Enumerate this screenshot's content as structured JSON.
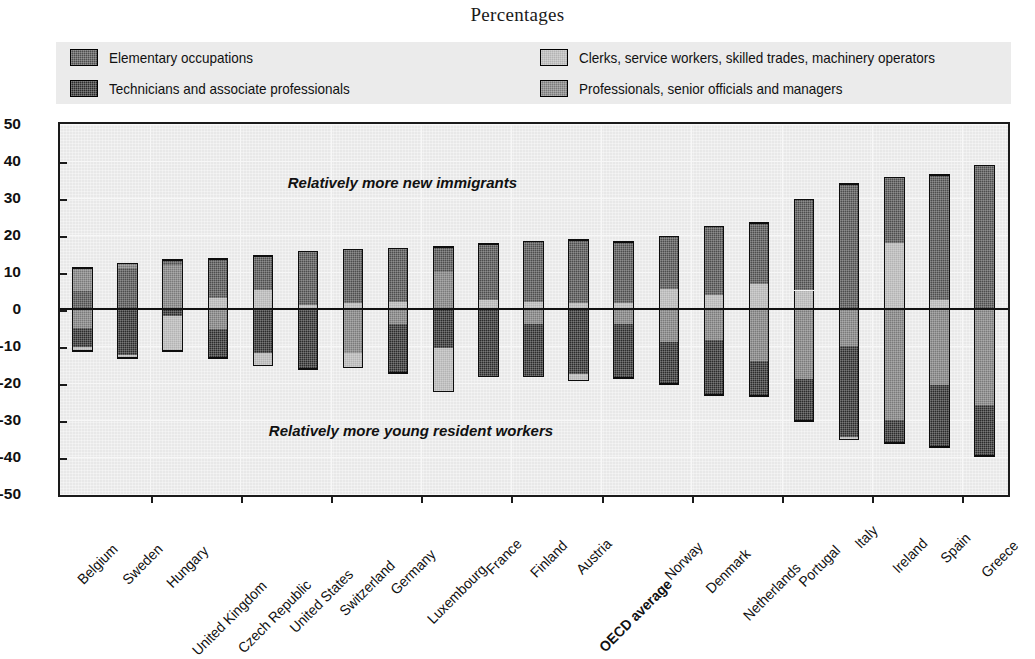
{
  "title": "Percentages",
  "legend": {
    "position": "top",
    "items": [
      {
        "label": "Elementary occupations",
        "color": "#4d4d4d",
        "key": "elementary"
      },
      {
        "label": "Clerks, service workers, skilled trades, machinery operators",
        "color": "#b3b3b3",
        "key": "clerks"
      },
      {
        "label": "Technicians and associate professionals",
        "color": "#2b2b2b",
        "key": "technicians"
      },
      {
        "label": "Professionals, senior officials and managers",
        "color": "#7a7a7a",
        "key": "professionals"
      }
    ]
  },
  "annotations": [
    {
      "text": "Relatively more new immigrants",
      "x_pct": 24,
      "y_value": 34
    },
    {
      "text": "Relatively more young resident workers",
      "x_pct": 22,
      "y_value": -33
    }
  ],
  "chart_data": {
    "type": "bar",
    "subtype": "diverging-stacked",
    "title": "Percentages",
    "xlabel": "",
    "ylabel": "",
    "ylim": [
      -50,
      50
    ],
    "yticks": [
      50,
      40,
      30,
      20,
      10,
      0,
      -10,
      -20,
      -30,
      -40,
      -50
    ],
    "ytick_labels": [
      "50",
      "40",
      "30",
      "20",
      "10",
      "0",
      "-10",
      "-20",
      "-30",
      "-40",
      "-50"
    ],
    "grid": true,
    "zero_line": 0,
    "categories": [
      "Belgium",
      "Sweden",
      "Hungary",
      "United Kingdom",
      "Czech Republic",
      "United States",
      "Switzerland",
      "Germany",
      "Luxembourg",
      "France",
      "Finland",
      "Austria",
      "OECD average",
      "Norway",
      "Denmark",
      "Netherlands",
      "Portugal",
      "Italy",
      "Ireland",
      "Spain",
      "Greece"
    ],
    "highlight_category": "OECD average",
    "series": [
      {
        "name": "Elementary occupations",
        "key": "elementary",
        "color": "#4d4d4d",
        "values": [
          11.3,
          12.5,
          1.0,
          10.6,
          9.2,
          14.5,
          14.5,
          14.7,
          7.0,
          15.5,
          16.2,
          17.0,
          16.8,
          14.5,
          18.8,
          16.8,
          24.6,
          34.0,
          17.8,
          34.0,
          39.0
        ]
      },
      {
        "name": "Clerks, service workers, skilled trades, machinery operators",
        "key": "clerks",
        "color": "#b3b3b3",
        "values": [
          -3.5,
          -1.0,
          -10.5,
          -8.0,
          -16.5,
          -16.5,
          -15.5,
          -2.0,
          -13.0,
          -1.0,
          -2.0,
          -1.5,
          -2.0,
          -9.5,
          -8.5,
          -14.5,
          -19.0,
          -35.5,
          17.8,
          2.5,
          -1.0
        ]
      },
      {
        "name": "Technicians and associate professionals",
        "key": "technicians",
        "color": "#2b2b2b",
        "values": [
          -7.5,
          -13.0,
          -2.5,
          -3.0,
          -3.0,
          -1.0,
          -2.5,
          -15.5,
          -10.0,
          -17.5,
          -16.5,
          -17.5,
          -17.0,
          -11.0,
          -15.0,
          -9.0,
          -11.5,
          -1.5,
          -30.5,
          -17.0,
          -14.0
        ]
      },
      {
        "name": "Professionals, senior officials and managers",
        "key": "professionals",
        "color": "#7a7a7a",
        "values": [
          6.5,
          1.5,
          12.5,
          3.5,
          5.5,
          1.5,
          -2.0,
          2.0,
          17.0,
          2.5,
          2.0,
          1.5,
          1.5,
          5.5,
          4.0,
          7.0,
          5.5,
          -10.0,
          -6.0,
          -20.5,
          -26.0
        ]
      }
    ],
    "stacks": [
      {
        "category": "Belgium",
        "pos": [
          {
            "key": "elementary",
            "from": 0,
            "to": 4.8
          },
          {
            "key": "professionals",
            "from": 4.8,
            "to": 11.3
          }
        ],
        "neg": [
          {
            "key": "professionals",
            "from": 0,
            "to": -5.0
          },
          {
            "key": "technicians",
            "from": -5.0,
            "to": -10.4
          },
          {
            "key": "clerks",
            "from": -10.4,
            "to": -11.6
          }
        ]
      },
      {
        "category": "Sweden",
        "pos": [
          {
            "key": "elementary",
            "from": 0,
            "to": 11.0
          },
          {
            "key": "professionals",
            "from": 11.0,
            "to": 12.5
          }
        ],
        "neg": [
          {
            "key": "technicians",
            "from": 0,
            "to": -12.5
          },
          {
            "key": "clerks",
            "from": -12.5,
            "to": -13.5
          }
        ]
      },
      {
        "category": "Hungary",
        "pos": [
          {
            "key": "professionals",
            "from": 0,
            "to": 12.0
          },
          {
            "key": "elementary",
            "from": 12.0,
            "to": 13.5
          }
        ],
        "neg": [
          {
            "key": "technicians",
            "from": 0,
            "to": -2.0
          },
          {
            "key": "clerks",
            "from": -2.0,
            "to": -11.5
          }
        ]
      },
      {
        "category": "United Kingdom",
        "pos": [
          {
            "key": "clerks",
            "from": 0,
            "to": 3.0
          },
          {
            "key": "elementary",
            "from": 3.0,
            "to": 13.8
          }
        ],
        "neg": [
          {
            "key": "professionals",
            "from": 0,
            "to": -5.5
          },
          {
            "key": "technicians",
            "from": -5.5,
            "to": -13.5
          }
        ]
      },
      {
        "category": "Czech Republic",
        "pos": [
          {
            "key": "clerks",
            "from": 0,
            "to": 5.2
          },
          {
            "key": "elementary",
            "from": 5.2,
            "to": 14.5
          }
        ],
        "neg": [
          {
            "key": "technicians",
            "from": 0,
            "to": -12.0
          },
          {
            "key": "clerks",
            "from": -12.0,
            "to": -15.5
          }
        ]
      },
      {
        "category": "United States",
        "pos": [
          {
            "key": "clerks",
            "from": 0,
            "to": 1.0
          },
          {
            "key": "elementary",
            "from": 1.0,
            "to": 15.8
          }
        ],
        "neg": [
          {
            "key": "technicians",
            "from": 0,
            "to": -16.5
          }
        ]
      },
      {
        "category": "Switzerland",
        "pos": [
          {
            "key": "clerks",
            "from": 0,
            "to": 1.5
          },
          {
            "key": "elementary",
            "from": 1.5,
            "to": 16.3
          }
        ],
        "neg": [
          {
            "key": "professionals",
            "from": 0,
            "to": -12.0
          },
          {
            "key": "clerks",
            "from": -12.0,
            "to": -16.0
          }
        ]
      },
      {
        "category": "Germany",
        "pos": [
          {
            "key": "clerks",
            "from": 0,
            "to": 2.0
          },
          {
            "key": "elementary",
            "from": 2.0,
            "to": 16.6
          }
        ],
        "neg": [
          {
            "key": "professionals",
            "from": 0,
            "to": -4.0
          },
          {
            "key": "technicians",
            "from": -4.0,
            "to": -17.5
          }
        ]
      },
      {
        "category": "Luxembourg",
        "pos": [
          {
            "key": "professionals",
            "from": 0,
            "to": 10.0
          },
          {
            "key": "elementary",
            "from": 10.0,
            "to": 17.0
          }
        ],
        "neg": [
          {
            "key": "technicians",
            "from": 0,
            "to": -10.5
          },
          {
            "key": "clerks",
            "from": -10.5,
            "to": -22.5
          }
        ]
      },
      {
        "category": "France",
        "pos": [
          {
            "key": "clerks",
            "from": 0,
            "to": 2.5
          },
          {
            "key": "elementary",
            "from": 2.5,
            "to": 17.8
          }
        ],
        "neg": [
          {
            "key": "technicians",
            "from": 0,
            "to": -18.5
          }
        ]
      },
      {
        "category": "Finland",
        "pos": [
          {
            "key": "clerks",
            "from": 0,
            "to": 2.0
          },
          {
            "key": "elementary",
            "from": 2.0,
            "to": 18.5
          }
        ],
        "neg": [
          {
            "key": "professionals",
            "from": 0,
            "to": -4.0
          },
          {
            "key": "technicians",
            "from": -4.0,
            "to": -18.5
          }
        ]
      },
      {
        "category": "Austria",
        "pos": [
          {
            "key": "clerks",
            "from": 0,
            "to": 1.5
          },
          {
            "key": "elementary",
            "from": 1.5,
            "to": 18.8
          }
        ],
        "neg": [
          {
            "key": "technicians",
            "from": 0,
            "to": -17.5
          },
          {
            "key": "clerks",
            "from": -17.5,
            "to": -19.5
          }
        ]
      },
      {
        "category": "OECD average",
        "pos": [
          {
            "key": "clerks",
            "from": 0,
            "to": 1.5
          },
          {
            "key": "elementary",
            "from": 1.5,
            "to": 18.3
          }
        ],
        "neg": [
          {
            "key": "professionals",
            "from": 0,
            "to": -4.0
          },
          {
            "key": "technicians",
            "from": -4.0,
            "to": -18.8
          }
        ]
      },
      {
        "category": "Norway",
        "pos": [
          {
            "key": "clerks",
            "from": 0,
            "to": 5.5
          },
          {
            "key": "elementary",
            "from": 5.5,
            "to": 19.8
          }
        ],
        "neg": [
          {
            "key": "professionals",
            "from": 0,
            "to": -9.0
          },
          {
            "key": "technicians",
            "from": -9.0,
            "to": -20.5
          }
        ]
      },
      {
        "category": "Denmark",
        "pos": [
          {
            "key": "clerks",
            "from": 0,
            "to": 3.8
          },
          {
            "key": "elementary",
            "from": 3.8,
            "to": 22.5
          }
        ],
        "neg": [
          {
            "key": "professionals",
            "from": 0,
            "to": -8.5
          },
          {
            "key": "technicians",
            "from": -8.5,
            "to": -23.5
          }
        ]
      },
      {
        "category": "Netherlands",
        "pos": [
          {
            "key": "clerks",
            "from": 0,
            "to": 6.8
          },
          {
            "key": "elementary",
            "from": 6.8,
            "to": 23.5
          }
        ],
        "neg": [
          {
            "key": "professionals",
            "from": 0,
            "to": -14.0
          },
          {
            "key": "technicians",
            "from": -14.0,
            "to": -23.8
          }
        ]
      },
      {
        "category": "Portugal",
        "pos": [
          {
            "key": "clerks",
            "from": 0,
            "to": 5.0
          },
          {
            "key": "elementary",
            "from": 5.0,
            "to": 29.8
          }
        ],
        "neg": [
          {
            "key": "professionals",
            "from": 0,
            "to": -19.0
          },
          {
            "key": "technicians",
            "from": -19.0,
            "to": -30.5
          }
        ]
      },
      {
        "category": "Italy",
        "pos": [
          {
            "key": "elementary",
            "from": 0,
            "to": 34.0
          }
        ],
        "neg": [
          {
            "key": "professionals",
            "from": 0,
            "to": -10.0
          },
          {
            "key": "technicians",
            "from": -10.0,
            "to": -34.5
          },
          {
            "key": "clerks",
            "from": -34.5,
            "to": -35.5
          }
        ]
      },
      {
        "category": "Ireland",
        "pos": [
          {
            "key": "clerks",
            "from": 0,
            "to": 17.8
          },
          {
            "key": "elementary",
            "from": 17.8,
            "to": 35.8
          }
        ],
        "neg": [
          {
            "key": "professionals",
            "from": 0,
            "to": -30.0
          },
          {
            "key": "technicians",
            "from": -30.0,
            "to": -36.5
          }
        ]
      },
      {
        "category": "Spain",
        "pos": [
          {
            "key": "clerks",
            "from": 0,
            "to": 2.5
          },
          {
            "key": "elementary",
            "from": 2.5,
            "to": 36.5
          }
        ],
        "neg": [
          {
            "key": "professionals",
            "from": 0,
            "to": -20.5
          },
          {
            "key": "technicians",
            "from": -20.5,
            "to": -37.5
          }
        ]
      },
      {
        "category": "Greece",
        "pos": [
          {
            "key": "elementary",
            "from": 0,
            "to": 39.0
          }
        ],
        "neg": [
          {
            "key": "professionals",
            "from": 0,
            "to": -26.0
          },
          {
            "key": "technicians",
            "from": -26.0,
            "to": -40.0
          }
        ]
      }
    ]
  }
}
